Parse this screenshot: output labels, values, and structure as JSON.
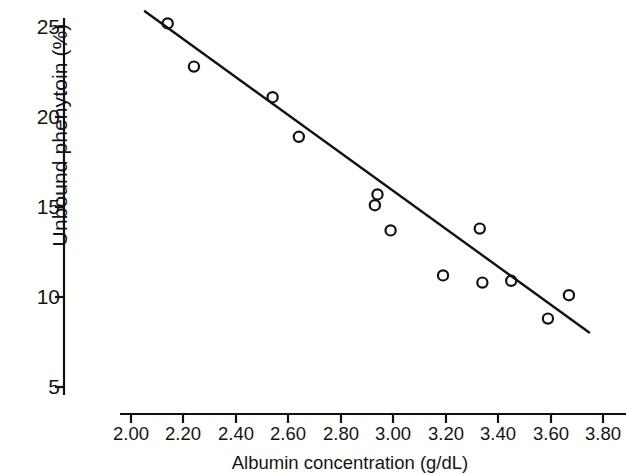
{
  "chart_data": {
    "type": "scatter",
    "title": "",
    "xlabel": "Albumin concentration (g/dL)",
    "ylabel": "Unbound phenytoin (%)",
    "xlim": [
      2.0,
      3.8
    ],
    "ylim": [
      5,
      25
    ],
    "grid": false,
    "legend": null,
    "xticks": [
      2.0,
      2.2,
      2.4,
      2.6,
      2.8,
      3.0,
      3.2,
      3.4,
      3.6,
      3.8
    ],
    "xtick_labels": [
      "2.00",
      "2.20",
      "2.40",
      "2.60",
      "2.80",
      "3.00",
      "3.20",
      "3.40",
      "3.60",
      "3.80"
    ],
    "yticks": [
      5,
      10,
      15,
      20,
      25
    ],
    "ytick_labels": [
      "5",
      "10",
      "15",
      "20",
      "25"
    ],
    "marker": "open-circle",
    "marker_color": "#111111",
    "line_color": "#111111",
    "series": [
      {
        "name": "Unbound phenytoin vs albumin",
        "points": [
          {
            "x": 2.14,
            "y": 25.2
          },
          {
            "x": 2.24,
            "y": 22.8
          },
          {
            "x": 2.54,
            "y": 21.1
          },
          {
            "x": 2.64,
            "y": 18.9
          },
          {
            "x": 2.94,
            "y": 15.7
          },
          {
            "x": 2.93,
            "y": 15.1
          },
          {
            "x": 2.99,
            "y": 13.7
          },
          {
            "x": 3.19,
            "y": 11.2
          },
          {
            "x": 3.33,
            "y": 13.8
          },
          {
            "x": 3.34,
            "y": 10.8
          },
          {
            "x": 3.45,
            "y": 10.9
          },
          {
            "x": 3.59,
            "y": 8.8
          },
          {
            "x": 3.67,
            "y": 10.1
          }
        ]
      }
    ],
    "fit_line": {
      "name": "regression-line",
      "x_start": 2.05,
      "y_start": 25.9,
      "x_end": 3.75,
      "y_end": 8.0
    }
  }
}
